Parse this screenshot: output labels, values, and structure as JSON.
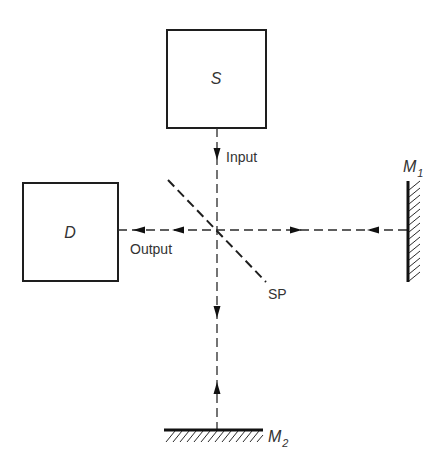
{
  "diagram": {
    "source_box": {
      "label": "S",
      "x": 167,
      "y": 30,
      "w": 99,
      "h": 98
    },
    "detector_box": {
      "label": "D",
      "x": 23,
      "y": 183,
      "w": 95,
      "h": 98
    },
    "beam_splitter": {
      "label": "SP",
      "x1": 168,
      "y1": 180,
      "x2": 266,
      "y2": 282
    },
    "mirror_1": {
      "label": "M",
      "subscript": "1",
      "x": 408,
      "y1": 181,
      "y2": 282
    },
    "mirror_2": {
      "label": "M",
      "subscript": "2",
      "y": 430,
      "x1": 164,
      "x2": 263
    },
    "beam_center": {
      "x": 217,
      "y": 230
    },
    "labels": {
      "input": "Input",
      "output": "Output",
      "splitter": "SP"
    },
    "arrows": [
      {
        "name": "input-arrow",
        "x": 217,
        "y": 155,
        "dir": "down"
      },
      {
        "name": "output-arrow-1",
        "x": 177,
        "y": 230,
        "dir": "left"
      },
      {
        "name": "output-arrow-2",
        "x": 138,
        "y": 230,
        "dir": "left"
      },
      {
        "name": "to-m1-arrow",
        "x": 297,
        "y": 230,
        "dir": "right"
      },
      {
        "name": "from-m1-arrow",
        "x": 372,
        "y": 230,
        "dir": "left"
      },
      {
        "name": "to-m2-arrow",
        "x": 217,
        "y": 313,
        "dir": "down"
      },
      {
        "name": "from-m2-arrow",
        "x": 217,
        "y": 387,
        "dir": "up"
      }
    ],
    "colors": {
      "ink": "#1e1e1e",
      "text": "#333333",
      "background": "#ffffff"
    }
  }
}
